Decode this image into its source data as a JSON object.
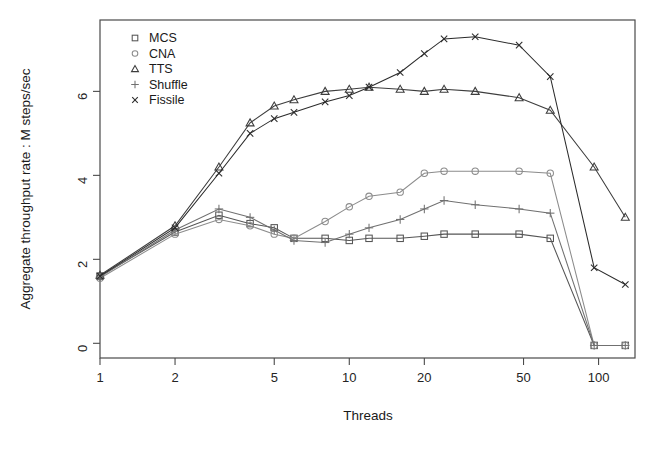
{
  "chart_data": {
    "type": "line",
    "title": "",
    "xlabel": "Threads",
    "ylabel": "Aggregate throughput rate : M steps/sec",
    "xscale": "log",
    "xlim": [
      1,
      140
    ],
    "ylim": [
      -0.35,
      7.7
    ],
    "xticks": [
      1,
      2,
      5,
      10,
      20,
      50,
      100
    ],
    "xticklabels": [
      "1",
      "2",
      "5",
      "10",
      "20",
      "50",
      "100"
    ],
    "yticks": [
      0,
      2,
      4,
      6
    ],
    "yticklabels": [
      "0",
      "2",
      "4",
      "6"
    ],
    "grid": false,
    "legend_position": "top-left",
    "series": [
      {
        "name": "MCS",
        "marker": "square",
        "color": "#555555",
        "x": [
          1,
          2,
          3,
          4,
          5,
          6,
          8,
          10,
          12,
          16,
          20,
          24,
          32,
          48,
          64,
          96,
          128
        ],
        "y": [
          1.6,
          2.65,
          3.05,
          2.85,
          2.75,
          2.5,
          2.5,
          2.45,
          2.5,
          2.5,
          2.55,
          2.6,
          2.6,
          2.6,
          2.5,
          -0.05,
          -0.05
        ]
      },
      {
        "name": "CNA",
        "marker": "circle",
        "color": "#8c8c8c",
        "x": [
          1,
          2,
          3,
          4,
          5,
          6,
          8,
          10,
          12,
          16,
          20,
          24,
          32,
          48,
          64,
          96,
          128
        ],
        "y": [
          1.55,
          2.6,
          2.95,
          2.8,
          2.6,
          2.5,
          2.9,
          3.25,
          3.5,
          3.6,
          4.05,
          4.1,
          4.1,
          4.1,
          4.05,
          -0.05,
          -0.05
        ]
      },
      {
        "name": "TTS",
        "marker": "triangle",
        "color": "#3d3d3d",
        "x": [
          1,
          2,
          3,
          4,
          5,
          6,
          8,
          10,
          12,
          16,
          20,
          24,
          32,
          48,
          64,
          96,
          128
        ],
        "y": [
          1.62,
          2.8,
          4.2,
          5.25,
          5.65,
          5.8,
          6.0,
          6.05,
          6.1,
          6.05,
          6.0,
          6.05,
          6.0,
          5.85,
          5.55,
          4.2,
          3.0
        ]
      },
      {
        "name": "Shuffle",
        "marker": "plus",
        "color": "#707070",
        "x": [
          1,
          2,
          3,
          4,
          5,
          6,
          8,
          10,
          12,
          16,
          20,
          24,
          32,
          48,
          64,
          96,
          128
        ],
        "y": [
          1.58,
          2.7,
          3.2,
          3.0,
          2.7,
          2.45,
          2.4,
          2.6,
          2.75,
          2.95,
          3.2,
          3.4,
          3.3,
          3.2,
          3.1,
          -0.05,
          -0.05
        ]
      },
      {
        "name": "Fissile",
        "marker": "cross",
        "color": "#2b2b2b",
        "x": [
          1,
          2,
          3,
          4,
          5,
          6,
          8,
          10,
          12,
          16,
          20,
          24,
          32,
          48,
          64,
          96,
          128
        ],
        "y": [
          1.6,
          2.75,
          4.05,
          5.0,
          5.35,
          5.5,
          5.75,
          5.9,
          6.1,
          6.45,
          6.9,
          7.25,
          7.3,
          7.1,
          6.35,
          1.8,
          1.4
        ]
      }
    ],
    "legend": [
      {
        "label": "MCS",
        "marker": "square"
      },
      {
        "label": "CNA",
        "marker": "circle"
      },
      {
        "label": "TTS",
        "marker": "triangle"
      },
      {
        "label": "Shuffle",
        "marker": "plus"
      },
      {
        "label": "Fissile",
        "marker": "cross"
      }
    ]
  },
  "colors": {
    "background": "#ffffff",
    "axis": "#4a4a4a",
    "text": "#1a1a1a"
  }
}
